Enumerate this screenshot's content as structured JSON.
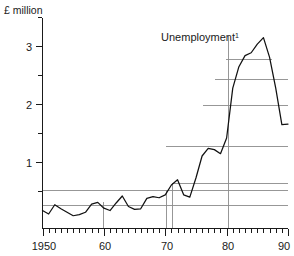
{
  "chart_data": {
    "type": "line",
    "title": "",
    "unit_label": "£ million",
    "series_label": "Unemployment",
    "series_label_superscript": "1",
    "xlabel": "",
    "ylabel": "",
    "xlim": [
      1950,
      1990
    ],
    "ylim": [
      0,
      3.6
    ],
    "grid": false,
    "legend_position": "inline-annotation",
    "y_ticks_major": [
      1,
      2,
      3
    ],
    "y_tick_labels": [
      "1",
      "2",
      "3"
    ],
    "y_ticks_minor": [
      0.5,
      1.5,
      2.5,
      3.5
    ],
    "x_ticks_major": [
      1950,
      1960,
      1970,
      1980,
      1990
    ],
    "x_tick_labels": [
      "1950",
      "60",
      "70",
      "80",
      "90"
    ],
    "x_minor_tick_interval": 1,
    "line_color": "#111111",
    "reference_line_color": "#8c8c8c",
    "axis_color": "#1a1a1a",
    "reference_lines_vertical": [
      1960,
      1970,
      1971,
      1980
    ],
    "reference_lines_horizontal": [
      0.35,
      0.45,
      0.55,
      1.5,
      2.2,
      2.65,
      3.0
    ],
    "series": [
      {
        "name": "Unemployment",
        "x": [
          1950,
          1951,
          1952,
          1953,
          1954,
          1955,
          1956,
          1957,
          1958,
          1959,
          1960,
          1961,
          1962,
          1963,
          1964,
          1965,
          1966,
          1967,
          1968,
          1969,
          1970,
          1971,
          1972,
          1973,
          1974,
          1975,
          1976,
          1977,
          1978,
          1979,
          1980,
          1981,
          1982,
          1983,
          1984,
          1985,
          1986,
          1987,
          1988,
          1989,
          1990
        ],
        "values": [
          0.31,
          0.25,
          0.41,
          0.34,
          0.28,
          0.22,
          0.24,
          0.28,
          0.42,
          0.45,
          0.35,
          0.31,
          0.44,
          0.56,
          0.38,
          0.33,
          0.34,
          0.52,
          0.55,
          0.53,
          0.58,
          0.75,
          0.84,
          0.58,
          0.54,
          0.87,
          1.25,
          1.38,
          1.36,
          1.29,
          1.56,
          2.42,
          2.79,
          2.98,
          3.03,
          3.18,
          3.29,
          2.95,
          2.42,
          1.79,
          1.8
        ]
      }
    ]
  },
  "figure": {
    "width": 294,
    "height": 256
  }
}
